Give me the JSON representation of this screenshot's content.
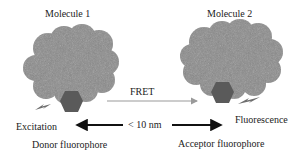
{
  "diagram": {
    "molecule1": {
      "label": "Molecule 1"
    },
    "molecule2": {
      "label": "Molecule 2"
    },
    "fret": {
      "label": "FRET"
    },
    "distance": {
      "label": "< 10 nm"
    },
    "excitation": {
      "label": "Excitation"
    },
    "fluorescence": {
      "label": "Fluorescence"
    },
    "donor": {
      "label": "Donor fluorophore"
    },
    "acceptor": {
      "label": "Acceptor fluorophore"
    }
  },
  "colors": {
    "cloud": "#8a8a8a",
    "hexagon": "#5a5a5a",
    "bolt": "#6e6e6e",
    "fret_arrow": "#9a9a9a",
    "distance_arrow": "#111111"
  }
}
